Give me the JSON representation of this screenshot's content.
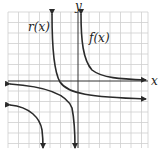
{
  "diagram": {
    "type": "function-graph",
    "axes": {
      "x_label": "x",
      "y_label": "y"
    },
    "grid": {
      "left": 8,
      "top": 12,
      "right": 148,
      "bottom": 148,
      "step": 10.5,
      "color": "#c9c9c9"
    },
    "curves": [
      {
        "name": "r(x)",
        "label": "r(x)",
        "kind": "hyperbola",
        "vertical_asymptote_px": 52,
        "horizontal_asymptote": "below x-axis"
      },
      {
        "name": "f(x)",
        "label": "f(x)",
        "kind": "hyperbola",
        "vertical_asymptote_px": 80,
        "horizontal_asymptote": "x-axis"
      }
    ],
    "curve_color": "#2a2a2a"
  }
}
